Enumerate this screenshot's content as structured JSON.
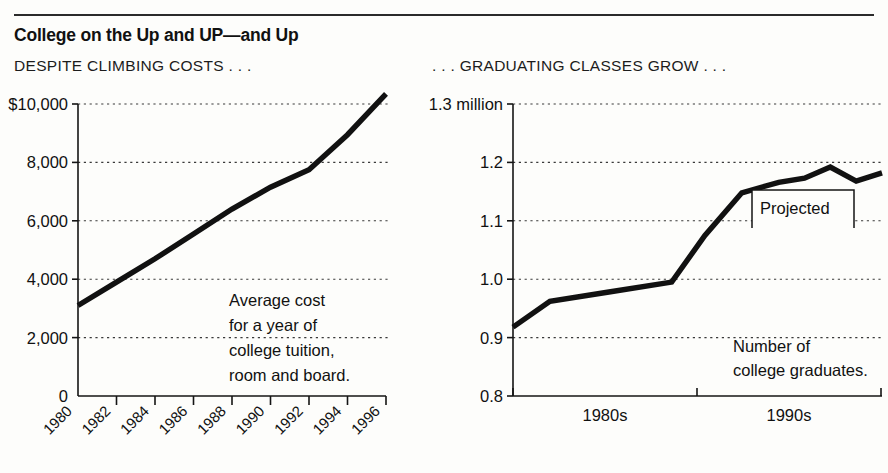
{
  "header": {
    "title": "College on the Up and UP—and Up",
    "subtitle_left": "DESPITE CLIMBING COSTS  .  .  .",
    "subtitle_right": ".  .  .  GRADUATING CLASSES GROW  .  .  ."
  },
  "chart_data": [
    {
      "id": "college-cost",
      "type": "line",
      "title": "DESPITE CLIMBING COSTS  .  .  .",
      "annotation": "Average cost for a year of college tuition, room and board.",
      "annotation_lines": [
        "Average cost",
        "for a year of",
        "college tuition,",
        "room and board."
      ],
      "xlabel": "",
      "ylabel": "",
      "ylim": [
        0,
        10000
      ],
      "yticks": [
        0,
        2000,
        4000,
        6000,
        8000,
        10000
      ],
      "ytick_labels": [
        "0",
        "2,000",
        "4,000",
        "6,000",
        "8,000",
        "$10,000"
      ],
      "grid": true,
      "legend": "none",
      "categories": [
        "1980",
        "1982",
        "1984",
        "1986",
        "1988",
        "1990",
        "1992",
        "1994",
        "1996"
      ],
      "x": [
        1980,
        1982,
        1984,
        1986,
        1988,
        1990,
        1992,
        1994,
        1996
      ],
      "values": [
        3100,
        3900,
        4700,
        5550,
        6400,
        7150,
        7750,
        8950,
        10350
      ],
      "series_name": "Average cost for a year of college tuition, room and board"
    },
    {
      "id": "college-graduates",
      "type": "line",
      "title": ".  .  .  GRADUATING CLASSES GROW  .  .  .",
      "annotation": "Number of college graduates.",
      "annotation_lines": [
        "Number of",
        "college graduates."
      ],
      "xlabel": "",
      "ylabel": "",
      "ylim": [
        0.8,
        1.3
      ],
      "yticks": [
        0.8,
        0.9,
        1.0,
        1.1,
        1.2,
        1.3
      ],
      "ytick_labels": [
        "0.8",
        "0.9",
        "1.0",
        "1.1",
        "1.2",
        "1.3 million"
      ],
      "grid": true,
      "legend": "none",
      "categories": [
        "1980s",
        "1990s"
      ],
      "xtick_labels": [
        "1980s",
        "1990s"
      ],
      "x": [
        0.0,
        0.1,
        0.26,
        0.43,
        0.52,
        0.62,
        0.72,
        0.79,
        0.86,
        0.93,
        1.0
      ],
      "values": [
        0.918,
        0.962,
        0.978,
        0.995,
        1.075,
        1.148,
        1.166,
        1.173,
        1.192,
        1.168,
        1.182
      ],
      "projected_label": "Projected",
      "series_name": "Number of college graduates"
    }
  ],
  "colors": {
    "background": "#fdfdfb",
    "ink": "#111111",
    "grid": "#3a3a3a",
    "rule": "#2b2b2b"
  }
}
